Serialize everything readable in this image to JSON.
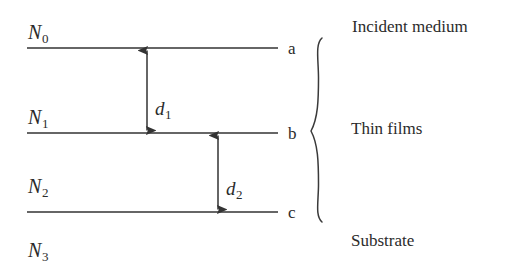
{
  "figure": {
    "type": "schematic-diagram",
    "background_color": "#ffffff",
    "line_color": "#333333"
  },
  "media": [
    {
      "id": "n0",
      "symbol": "N",
      "subscript": "0",
      "x": 28,
      "y": 22,
      "region": "incident medium"
    },
    {
      "id": "n1",
      "symbol": "N",
      "subscript": "1",
      "x": 28,
      "y": 107,
      "region": "thin film 1"
    },
    {
      "id": "n2",
      "symbol": "N",
      "subscript": "2",
      "x": 28,
      "y": 176,
      "region": "thin film 2"
    },
    {
      "id": "n3",
      "symbol": "N",
      "subscript": "3",
      "x": 28,
      "y": 240,
      "region": "substrate"
    }
  ],
  "interfaces": [
    {
      "id": "a",
      "label": "a",
      "y": 48,
      "x_start": 27,
      "x_end": 278,
      "label_x": 288,
      "label_y": 40
    },
    {
      "id": "b",
      "label": "b",
      "y": 133,
      "x_start": 27,
      "x_end": 278,
      "label_x": 288,
      "label_y": 125
    },
    {
      "id": "c",
      "label": "c",
      "y": 212,
      "x_start": 27,
      "x_end": 278,
      "label_x": 288,
      "label_y": 204
    }
  ],
  "thickness_arrows": [
    {
      "id": "d1",
      "symbol": "d",
      "subscript": "1",
      "x": 147,
      "y_top": 48,
      "y_bottom": 133,
      "label_x": 155,
      "label_y": 99,
      "between": "a-b"
    },
    {
      "id": "d2",
      "symbol": "d",
      "subscript": "2",
      "x": 218,
      "y_top": 133,
      "y_bottom": 212,
      "label_x": 226,
      "label_y": 179,
      "between": "b-c"
    }
  ],
  "brace": {
    "id": "thin-films-brace",
    "x": 318,
    "y_top": 38,
    "y_bottom": 222,
    "tip_x": 328,
    "mid_y": 131,
    "groups": "thin films"
  },
  "region_labels": [
    {
      "id": "incident-medium",
      "text": "Incident medium",
      "x": 352,
      "y": 18
    },
    {
      "id": "thin-films",
      "text": "Thin films",
      "x": 351,
      "y": 120
    },
    {
      "id": "substrate",
      "text": "Substrate",
      "x": 351,
      "y": 232
    }
  ]
}
